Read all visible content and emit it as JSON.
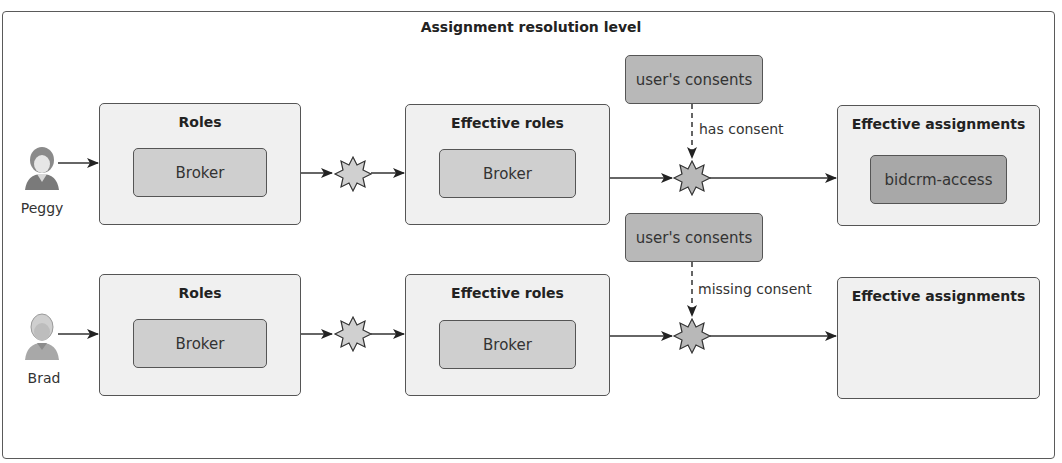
{
  "title": "Assignment resolution level",
  "rows": [
    {
      "user": {
        "name": "Peggy",
        "icon": "person-female-icon"
      },
      "roles": {
        "title": "Roles",
        "items": [
          "Broker"
        ]
      },
      "effective_roles": {
        "title": "Effective roles",
        "items": [
          "Broker"
        ]
      },
      "consents": {
        "label": "user's consents",
        "edge_label": "has consent",
        "edge_style": "dashed"
      },
      "effective_assignments": {
        "title": "Effective assignments",
        "items": [
          "bidcrm-access"
        ]
      }
    },
    {
      "user": {
        "name": "Brad",
        "icon": "person-male-icon"
      },
      "roles": {
        "title": "Roles",
        "items": [
          "Broker"
        ]
      },
      "effective_roles": {
        "title": "Effective roles",
        "items": [
          "Broker"
        ]
      },
      "consents": {
        "label": "user's consents",
        "edge_label": "missing consent",
        "edge_style": "dashed"
      },
      "effective_assignments": {
        "title": "Effective assignments",
        "items": []
      }
    }
  ],
  "colors": {
    "frame_border": "#5a5a5a",
    "box_fill": "#f0f0f0",
    "chip_fill": "#cfcfcf",
    "assignment_chip_fill": "#a8a8a8",
    "consent_fill": "#b8b8b8",
    "star_fill": "#c8c8c8"
  }
}
